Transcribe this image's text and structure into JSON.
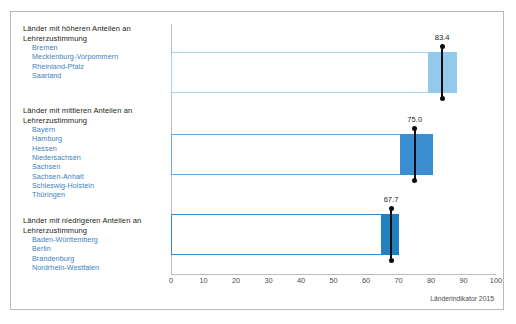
{
  "chart_data": {
    "type": "bar",
    "title": "",
    "subtitle": "",
    "xlabel": "",
    "ylabel": "",
    "xlim": [
      0,
      100
    ],
    "xticks": [
      0,
      10,
      20,
      30,
      40,
      50,
      60,
      70,
      80,
      90,
      100
    ],
    "xtick_labels": [
      "0",
      "10",
      "20",
      "30",
      "40",
      "50",
      "60",
      "70",
      "80",
      "90",
      "100"
    ],
    "grid": false,
    "legend": "none",
    "orientation": "horizontal",
    "source_note": "Länderindikator 2015",
    "categories": [
      "Länder mit höheren Anteilen an Lehrerzustimmung",
      "Länder mit mittleren Anteilen an Lehrerzustimmung",
      "Länder mit niedrigeren Anteilen an Lehrerzustimmung"
    ],
    "values": [
      83.4,
      75.0,
      67.7
    ],
    "value_labels": [
      "83.4",
      "75.0",
      "67.7"
    ],
    "ci_low": [
      79.2,
      70.5,
      64.5
    ],
    "ci_high": [
      88.0,
      80.5,
      70.3
    ],
    "bar_colors": [
      "#a9d3ee",
      "#64a9dc",
      "#2f8bcb"
    ],
    "ci_fill_colors": [
      "#93c9ea",
      "#3a8fd0",
      "#2080c0"
    ],
    "errorbar_color": "#0d0d0d",
    "groups": [
      {
        "title": "Länder mit höheren Anteilen an\nLehrerzustimmung",
        "value": 83.4,
        "states": [
          "Bremen",
          "Mecklenburg-Vorpommern",
          "Rheinland-Pfalz",
          "Saarland"
        ]
      },
      {
        "title": "Länder mit mittleren Anteilen an\nLehrerzustimmung",
        "value": 75.0,
        "states": [
          "Bayern",
          "Hamburg",
          "Hessen",
          "Niedersachsen",
          "Sachsen",
          "Sachsen-Anhalt",
          "Schleswig-Holstein",
          "Thüringen"
        ]
      },
      {
        "title": "Länder mit niedrigeren Anteilen an\nLehrerzustimmung",
        "value": 67.7,
        "states": [
          "Baden-Württemberg",
          "Berlin",
          "Brandenburg",
          "Nordrhein-Westfalen"
        ]
      }
    ]
  },
  "colors": {
    "frame": "#b9b9b9",
    "axis": "#bcbcbc",
    "state_text": "#3b7fbe",
    "title_text": "#231f20",
    "tick_text": "#4d4d4d"
  },
  "footer": {
    "source": "Länderindikator 2015"
  }
}
